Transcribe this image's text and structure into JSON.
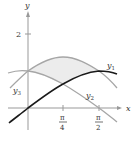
{
  "figure": {
    "axes": {
      "x_label": "x",
      "y_label": "y"
    },
    "y_ticks": [
      {
        "label": "2",
        "value": 2
      }
    ],
    "x_ticks": [
      {
        "num": "π",
        "den": "4",
        "value": 0.7854
      },
      {
        "num": "π",
        "den": "2",
        "value": 1.5708
      }
    ],
    "curves": [
      {
        "name": "y1",
        "label": "y",
        "sub": "1",
        "expr": "sin x",
        "color": "#1a1a1a"
      },
      {
        "name": "y2",
        "label": "y",
        "sub": "2",
        "expr": "cos x",
        "color": "#a6a6a6"
      },
      {
        "name": "y3",
        "label": "y",
        "sub": "3",
        "expr": "sin x + cos x",
        "color": "#a6a6a6"
      }
    ],
    "shaded_region": {
      "between": [
        "y3",
        "max(y1,y2)"
      ],
      "interval": [
        0,
        1.5708
      ],
      "color": "#ececec"
    }
  }
}
